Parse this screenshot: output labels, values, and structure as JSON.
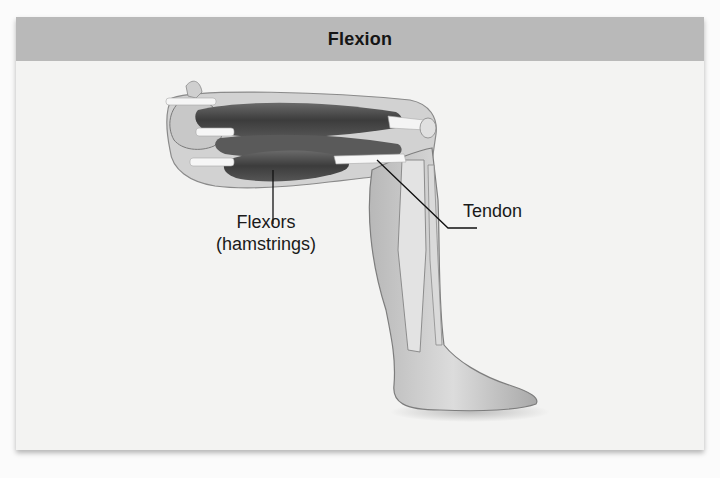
{
  "figure": {
    "title": "Flexion",
    "labels": {
      "flexors_line1": "Flexors",
      "flexors_line2": "(hamstrings)",
      "tendon": "Tendon"
    }
  },
  "colors": {
    "header_bg": "#b9b9b9",
    "panel_bg": "#f3f3f2",
    "muscle": "#4a4a4a",
    "skin": "#c9c9c9",
    "tendon": "#f4f4f4"
  }
}
